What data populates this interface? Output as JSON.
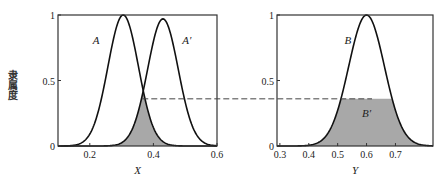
{
  "chart_data": [
    {
      "type": "line",
      "id": "left",
      "xlabel": "X",
      "ylabel": "隶属度",
      "xlim": [
        0.1,
        0.6
      ],
      "ylim": [
        0,
        1
      ],
      "xticks": [
        0.2,
        0.4,
        0.6
      ],
      "xtick_labels": [
        "0.2",
        "0.4",
        "0.6"
      ],
      "yticks": [
        0,
        0.5,
        1
      ],
      "ytick_labels": [
        "0",
        "0.5",
        "1"
      ],
      "grid": false,
      "series": [
        {
          "name": "A",
          "label": "A",
          "center": 0.305,
          "sigma": 0.048,
          "peak": 1.0,
          "label_at": [
            0.22,
            0.78
          ]
        },
        {
          "name": "A'",
          "label": "A′",
          "center": 0.43,
          "sigma": 0.048,
          "peak": 0.97,
          "label_at": [
            0.505,
            0.78
          ]
        }
      ],
      "shaded_region": {
        "description": "intersection min(A, A')",
        "color": "#a8a8a8"
      },
      "intersection": {
        "x": 0.365,
        "y": 0.36
      }
    },
    {
      "type": "line",
      "id": "right",
      "xlabel": "Y",
      "xlim": [
        0.29,
        0.83
      ],
      "ylim": [
        0,
        1
      ],
      "xticks": [
        0.3,
        0.4,
        0.5,
        0.6,
        0.7
      ],
      "xtick_labels": [
        "0.3",
        "0.4",
        "0.5",
        "0.6",
        "0.7"
      ],
      "yticks": [
        0,
        0.5,
        1
      ],
      "ytick_labels": [
        "0",
        "0.5",
        "1"
      ],
      "grid": false,
      "series": [
        {
          "name": "B",
          "label": "B",
          "center": 0.6,
          "sigma": 0.062,
          "peak": 1.0,
          "label_at": [
            0.535,
            0.78
          ]
        }
      ],
      "clipped": {
        "name": "B'",
        "label": "B′",
        "level": 0.36,
        "label_at": [
          0.6,
          0.22
        ],
        "color": "#a8a8a8"
      }
    }
  ],
  "connector": {
    "style": "dashed",
    "level": 0.36
  }
}
